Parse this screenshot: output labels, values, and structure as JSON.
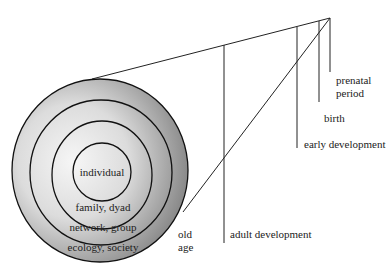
{
  "diagram": {
    "type": "life-span / ecological systems diagram",
    "circles": [
      {
        "label": "individual"
      },
      {
        "label": "family, dyad"
      },
      {
        "label": "network, group"
      },
      {
        "label": "ecology, society"
      }
    ],
    "timeline": [
      {
        "label_line1": "prenatal",
        "label_line2": "period"
      },
      {
        "label": "birth"
      },
      {
        "label": "early development"
      },
      {
        "label": "adult development"
      },
      {
        "label_line1": "old",
        "label_line2": "age"
      }
    ],
    "colors": {
      "line": "#222222",
      "fill_light": "#f4f4f4",
      "fill_dark": "#8a8a8a",
      "text": "#222222"
    }
  }
}
